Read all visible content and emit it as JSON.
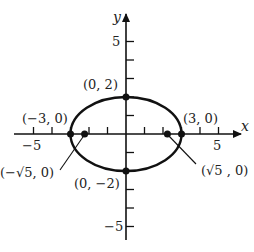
{
  "diagram": {
    "type": "ellipse-graph",
    "equation_hint": "x^2/9 + y^2/4 = 1",
    "axes": {
      "x_label": "x",
      "y_label": "y",
      "x_tick_labels": {
        "neg": "−5",
        "pos": "5"
      },
      "y_tick_labels": {
        "pos": "5",
        "neg": "−5"
      },
      "range": [
        -6,
        6
      ]
    },
    "points": {
      "top": "(0, 2)",
      "bottom": "(0, −2)",
      "left_vertex": "(−3, 0)",
      "right_vertex": "(3, 0)",
      "left_focus": "(−√5, 0)",
      "right_focus": "(√5 , 0)"
    },
    "ellipse": {
      "a": 3,
      "b": 2,
      "c": "√5"
    },
    "colors": {
      "stroke": "#111111",
      "text": "#222222"
    }
  }
}
